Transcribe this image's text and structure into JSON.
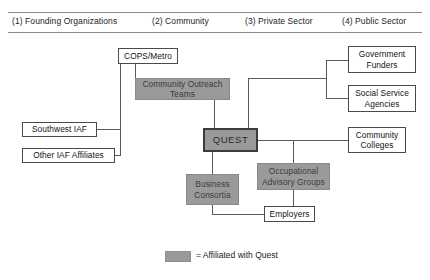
{
  "header": {
    "columns": [
      {
        "label": "(1) Founding Organizations",
        "x": 12
      },
      {
        "label": "(2) Community",
        "x": 152
      },
      {
        "label": "(3) Private Sector",
        "x": 245
      },
      {
        "label": "(4) Public Sector",
        "x": 342
      }
    ]
  },
  "nodes": {
    "cops_metro": "COPS/Metro",
    "community_outreach_teams": "Community Outreach Teams",
    "southwest_iaf": "Southwest IAF",
    "other_iaf_affiliates": "Other IAF Affiliates",
    "quest": "QUEST",
    "business_consortia": "Business Consortia",
    "occupational_advisory_groups": "Occupational Advisory Groups",
    "employers": "Employers",
    "government_funders": "Government Funders",
    "social_service_agencies": "Social Service Agencies",
    "community_colleges": "Community Colleges"
  },
  "legend": {
    "text": "= Affiliated with Quest",
    "swatch_color": "#9a9a9a"
  },
  "colors": {
    "affiliated_fill": "#9a9a9a",
    "external_fill": "#ffffff",
    "line": "#5a5a5a",
    "text": "#1c1c1c"
  }
}
